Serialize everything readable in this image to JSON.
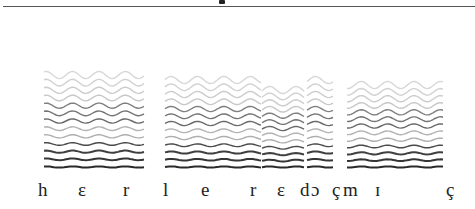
{
  "figure": {
    "type": "narrowband spectrogram with phonetic transcription",
    "top_rule": true
  },
  "transcription": {
    "symbols": [
      {
        "ipa": "h",
        "x": 38
      },
      {
        "ipa": "ɛ",
        "x": 78
      },
      {
        "ipa": "r",
        "x": 123
      },
      {
        "ipa": "l",
        "x": 163
      },
      {
        "ipa": "e",
        "x": 201
      },
      {
        "ipa": "r",
        "x": 250
      },
      {
        "ipa": "ɛ",
        "x": 277
      },
      {
        "ipa": "d",
        "x": 300
      },
      {
        "ipa": "ɔ",
        "x": 311
      },
      {
        "ipa": "ç",
        "x": 332
      },
      {
        "ipa": "m",
        "x": 343
      },
      {
        "ipa": "ɪ",
        "x": 375
      },
      {
        "ipa": "ç",
        "x": 446
      }
    ]
  },
  "spectrogram_segments": [
    {
      "name": "segment-1",
      "x0": 44,
      "x1": 144,
      "top": 75,
      "bottom": 167
    },
    {
      "name": "segment-2",
      "x0": 165,
      "x1": 262,
      "top": 80,
      "bottom": 167
    },
    {
      "name": "segment-3",
      "x0": 262,
      "x1": 305,
      "top": 90,
      "bottom": 167
    },
    {
      "name": "segment-4",
      "x0": 307,
      "x1": 334,
      "top": 80,
      "bottom": 167
    },
    {
      "name": "segment-5",
      "x0": 347,
      "x1": 444,
      "top": 85,
      "bottom": 167
    }
  ],
  "colors": {
    "ink": "#222222",
    "harmonic_dark": "#2a2a2a",
    "harmonic_light": "#9a9a9a",
    "background": "#ffffff"
  }
}
